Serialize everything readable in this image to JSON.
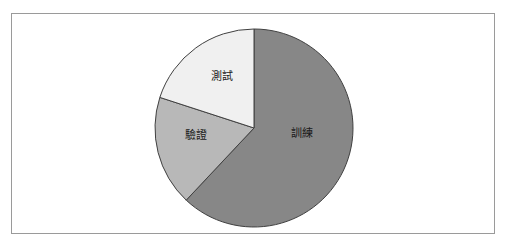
{
  "figure": {
    "background_color": "#ffffff",
    "frame_color": "#9a9a9a",
    "frame": {
      "x": 11,
      "y": 13,
      "width": 484,
      "height": 221
    }
  },
  "chart_data": {
    "type": "pie",
    "title": "",
    "subtitle": "",
    "xlabel": "",
    "ylabel": "",
    "grid": false,
    "legend_position": "none",
    "label_placement": "inside-slice",
    "start_angle_deg": 0,
    "direction": "clockwise",
    "center": {
      "cx": 254,
      "cy": 128
    },
    "radius": 99,
    "outline_color": "#404040",
    "outline_width": 1,
    "categories": [
      "訓練",
      "驗證",
      "測試"
    ],
    "values": [
      62,
      18,
      20
    ],
    "slices": [
      {
        "label": "訓練",
        "label_en": "Training",
        "value": 62,
        "percent": 62,
        "color": "#878787",
        "start_angle_deg": 0,
        "end_angle_deg": 223.2,
        "label_x": 302,
        "label_y": 133
      },
      {
        "label": "驗證",
        "label_en": "Validation",
        "value": 18,
        "percent": 18,
        "color": "#b8b8b8",
        "start_angle_deg": 223.2,
        "end_angle_deg": 288.0,
        "label_x": 196,
        "label_y": 135
      },
      {
        "label": "測試",
        "label_en": "Test",
        "value": 20,
        "percent": 20,
        "color": "#f0f0f0",
        "start_angle_deg": 288.0,
        "end_angle_deg": 360.0,
        "label_x": 222,
        "label_y": 76
      }
    ]
  }
}
